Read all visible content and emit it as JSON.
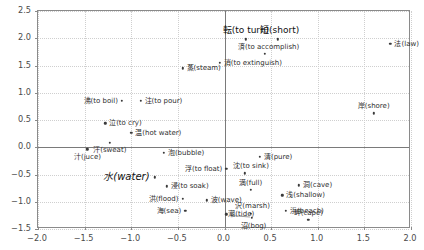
{
  "chart_data": {
    "type": "scatter",
    "title": "",
    "xlabel": "",
    "ylabel": "",
    "xlim": [
      -2.0,
      2.0
    ],
    "ylim": [
      -1.5,
      2.5
    ],
    "grid": true,
    "legend": "none",
    "xticks": [
      "-2.0",
      "-1.5",
      "-1.0",
      "-0.5",
      "0.0",
      "0.5",
      "1.0",
      "1.5",
      "2.0"
    ],
    "xtick_values": [
      -2.0,
      -1.5,
      -1.0,
      -0.5,
      0.0,
      0.5,
      1.0,
      1.5,
      2.0
    ],
    "yticks": [
      "2.5",
      "2.0",
      "1.5",
      "1.0",
      "0.5",
      "0.0",
      "-0.5",
      "-1.0",
      "-1.5"
    ],
    "ytick_values": [
      2.5,
      2.0,
      1.5,
      1.0,
      0.5,
      0.0,
      -0.5,
      -1.0,
      -1.5
    ],
    "point_color": "#3a3a3a",
    "grid_color": "#cfcfcf",
    "axis_color": "#7a7a7a",
    "points": [
      {
        "label": "転(to turn)",
        "x": 0.23,
        "y": 1.98,
        "size": "mid",
        "align": "c",
        "dx": 0,
        "dy": -9
      },
      {
        "label": "短(short)",
        "x": 0.57,
        "y": 1.98,
        "size": "mid",
        "align": "c",
        "dx": 2,
        "dy": -9
      },
      {
        "label": "法(law)",
        "x": 1.78,
        "y": 1.9,
        "size": "norm",
        "align": "l",
        "dx": 4,
        "dy": 0
      },
      {
        "label": "済(to accomplish)",
        "x": 0.43,
        "y": 1.72,
        "size": "norm",
        "align": "c",
        "dx": 4,
        "dy": -7
      },
      {
        "label": "消(to extinguish)",
        "x": -0.05,
        "y": 1.55,
        "size": "norm",
        "align": "l",
        "dx": 4,
        "dy": 0
      },
      {
        "label": "蒸(steam)",
        "x": -0.45,
        "y": 1.45,
        "size": "norm",
        "align": "l",
        "dx": 4,
        "dy": 0
      },
      {
        "label": "沸(to boil)",
        "x": -1.1,
        "y": 0.85,
        "size": "norm",
        "align": "r",
        "dx": -4,
        "dy": 0
      },
      {
        "label": "注(to pour)",
        "x": -0.9,
        "y": 0.85,
        "size": "norm",
        "align": "l",
        "dx": 4,
        "dy": 0
      },
      {
        "label": "岸(shore)",
        "x": 1.6,
        "y": 0.62,
        "size": "norm",
        "align": "c",
        "dx": 0,
        "dy": -7
      },
      {
        "label": "泣(to cry)",
        "x": -1.28,
        "y": 0.44,
        "size": "norm",
        "align": "l",
        "dx": 4,
        "dy": 0
      },
      {
        "label": "温(hot water)",
        "x": -1.0,
        "y": 0.26,
        "size": "norm",
        "align": "l",
        "dx": 4,
        "dy": 0
      },
      {
        "label": "汗(sweat)",
        "x": -1.23,
        "y": 0.08,
        "size": "norm",
        "align": "c",
        "dx": 0,
        "dy": 7
      },
      {
        "label": "汁(juce)",
        "x": -1.47,
        "y": -0.04,
        "size": "norm",
        "align": "c",
        "dx": 0,
        "dy": 8
      },
      {
        "label": "泡(bubble)",
        "x": -0.65,
        "y": -0.1,
        "size": "norm",
        "align": "l",
        "dx": 4,
        "dy": 0
      },
      {
        "label": "清(pure)",
        "x": 0.38,
        "y": -0.17,
        "size": "norm",
        "align": "l",
        "dx": 4,
        "dy": 0
      },
      {
        "label": "浮(to float)",
        "x": 0.02,
        "y": -0.4,
        "size": "norm",
        "align": "r",
        "dx": -4,
        "dy": 0
      },
      {
        "label": "沈(to sink)",
        "x": 0.22,
        "y": -0.48,
        "size": "norm",
        "align": "c",
        "dx": 6,
        "dy": -7
      },
      {
        "label": "水(water)",
        "x": -0.75,
        "y": -0.55,
        "size": "big",
        "align": "r",
        "dx": -5,
        "dy": 0
      },
      {
        "label": "浸(to soak)",
        "x": -0.62,
        "y": -0.72,
        "size": "norm",
        "align": "l",
        "dx": 4,
        "dy": 0
      },
      {
        "label": "洞(cave)",
        "x": 0.8,
        "y": -0.7,
        "size": "norm",
        "align": "l",
        "dx": 4,
        "dy": 0
      },
      {
        "label": "満(full)",
        "x": 0.28,
        "y": -0.78,
        "size": "norm",
        "align": "c",
        "dx": 0,
        "dy": -7
      },
      {
        "label": "浅(shallow)",
        "x": 0.62,
        "y": -0.88,
        "size": "norm",
        "align": "l",
        "dx": 4,
        "dy": 0
      },
      {
        "label": "洪(flood)",
        "x": -0.45,
        "y": -0.95,
        "size": "norm",
        "align": "r",
        "dx": -4,
        "dy": 0
      },
      {
        "label": "波(wave)",
        "x": -0.19,
        "y": -0.97,
        "size": "norm",
        "align": "l",
        "dx": 4,
        "dy": 0
      },
      {
        "label": "海(sea)",
        "x": -0.42,
        "y": -1.17,
        "size": "norm",
        "align": "r",
        "dx": -4,
        "dy": 0
      },
      {
        "label": "沢(marsh)",
        "x": 0.28,
        "y": -1.22,
        "size": "norm",
        "align": "c",
        "dx": 2,
        "dy": -8
      },
      {
        "label": "浜(beach)",
        "x": 0.66,
        "y": -1.17,
        "size": "norm",
        "align": "l",
        "dx": 4,
        "dy": 0
      },
      {
        "label": "潮(tide)",
        "x": 0.02,
        "y": -1.23,
        "size": "norm",
        "align": "l",
        "dx": 2,
        "dy": 0
      },
      {
        "label": "沼(bog)",
        "x": 0.29,
        "y": -1.3,
        "size": "norm",
        "align": "c",
        "dx": 2,
        "dy": 8
      },
      {
        "label": "岬(cape)",
        "x": 0.9,
        "y": -1.33,
        "size": "norm",
        "align": "c",
        "dx": 0,
        "dy": -7
      }
    ],
    "leader_lines": [
      {
        "x1": 0.07,
        "y1": -1.235,
        "x2": 0.27,
        "y2": -1.26
      }
    ]
  }
}
